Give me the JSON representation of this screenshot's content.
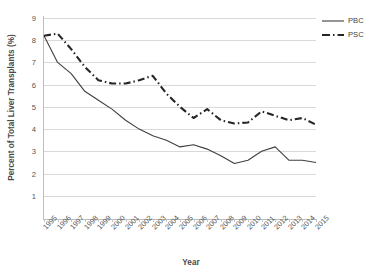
{
  "chart_data": {
    "type": "line",
    "title": "",
    "xlabel": "Year",
    "ylabel": "Percent of Total Liver Transplants (%)",
    "categories": [
      "1995",
      "1996",
      "1997",
      "1998",
      "1999",
      "2000",
      "2001",
      "2002",
      "2003",
      "2004",
      "2005",
      "2006",
      "2007",
      "2008",
      "2009",
      "2010",
      "2011",
      "2012",
      "2013",
      "2014",
      "2015"
    ],
    "x": [
      1995,
      1996,
      1997,
      1998,
      1999,
      2000,
      2001,
      2002,
      2003,
      2004,
      2005,
      2006,
      2007,
      2008,
      2009,
      2010,
      2011,
      2012,
      2013,
      2014,
      2015
    ],
    "ylim": [
      0,
      9
    ],
    "xlim": [
      1995,
      2015
    ],
    "ytick_labels": [
      "9",
      "8",
      "7",
      "6",
      "5",
      "4",
      "3",
      "2",
      "1"
    ],
    "ytick_values": [
      9,
      8,
      7,
      6,
      5,
      4,
      3,
      2,
      1
    ],
    "grid": true,
    "legend_position": "top-right",
    "series": [
      {
        "name": "PBC",
        "style": "solid",
        "color": "#3f3f3f",
        "values": [
          8.2,
          7.0,
          6.5,
          5.7,
          5.3,
          4.9,
          4.4,
          4.0,
          3.7,
          3.5,
          3.2,
          3.3,
          3.1,
          2.8,
          2.45,
          2.6,
          3.0,
          3.2,
          2.6,
          2.6,
          2.5
        ]
      },
      {
        "name": "PSC",
        "style": "dash-dot",
        "color": "#262626",
        "values": [
          8.2,
          8.3,
          7.6,
          6.8,
          6.2,
          6.05,
          6.05,
          6.2,
          6.4,
          5.6,
          5.0,
          4.5,
          4.9,
          4.4,
          4.25,
          4.3,
          4.8,
          4.6,
          4.4,
          4.5,
          4.2
        ]
      }
    ]
  },
  "legend": {
    "items": [
      {
        "label": "PBC"
      },
      {
        "label": "PSC"
      }
    ]
  }
}
